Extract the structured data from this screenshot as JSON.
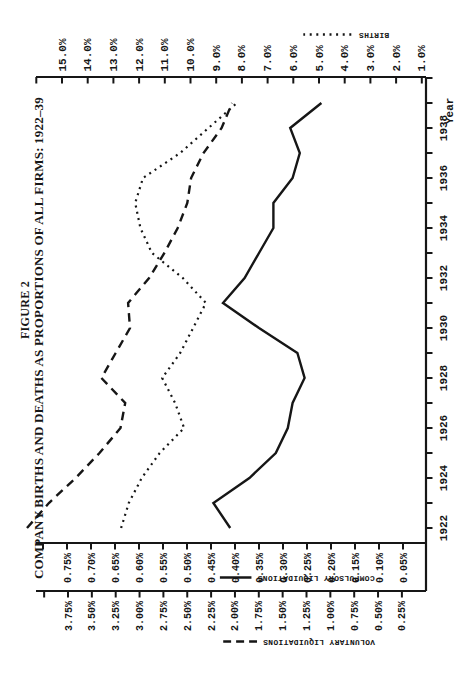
{
  "figure": {
    "title_line1": "FIGURE 2",
    "title_line2": "COMPANY BIRTHS AND DEATHS AS PROPORTIONS OF ALL FIRMS: 1922–39",
    "xaxis_title": "Year"
  },
  "legends": {
    "births": "BIRTHS",
    "compulsory": "COMPULSORY LIQUIDATIONS",
    "voluntary": "VOLUNTARY LIQUIDATIONS"
  },
  "chart_data": {
    "type": "line",
    "xlabel": "Year",
    "layout_note": "landscape chart printed rotated 90 degrees counter-clockwise on a portrait page; legend texts appear upside-down",
    "x": [
      1922,
      1923,
      1924,
      1925,
      1926,
      1927,
      1928,
      1929,
      1930,
      1931,
      1932,
      1933,
      1934,
      1935,
      1936,
      1937,
      1938,
      1939
    ],
    "x_tick_labels": [
      "1922",
      "1924",
      "1926",
      "1928",
      "1930",
      "1932",
      "1934",
      "1936",
      "1938"
    ],
    "series": [
      {
        "name": "BIRTHS",
        "style": "dotted",
        "scale": "births",
        "unit": "% of all firms",
        "values": [
          12.7,
          12.4,
          11.9,
          11.2,
          10.25,
          10.6,
          11.1,
          10.4,
          9.9,
          9.4,
          10.3,
          11.5,
          11.95,
          12.15,
          11.85,
          10.4,
          9.3,
          8.2
        ]
      },
      {
        "name": "VOLUNTARY LIQUIDATIONS",
        "style": "dashed",
        "scale": "voluntary",
        "unit": "% of all firms",
        "values": [
          4.18,
          3.95,
          3.67,
          3.42,
          3.2,
          3.15,
          3.4,
          3.25,
          3.1,
          3.12,
          2.9,
          2.74,
          2.6,
          2.5,
          2.46,
          2.33,
          2.14,
          2.03
        ]
      },
      {
        "name": "COMPULSORY LIQUIDATIONS",
        "style": "solid",
        "scale": "compulsory",
        "unit": "% of all firms",
        "values": [
          0.41,
          0.445,
          0.37,
          0.315,
          0.29,
          0.28,
          0.255,
          0.27,
          0.35,
          0.425,
          0.38,
          0.35,
          0.32,
          0.32,
          0.28,
          0.265,
          0.285,
          0.22
        ]
      }
    ],
    "axes": {
      "births": {
        "side": "right",
        "min": 1.0,
        "max": 15.0,
        "step": 1.0,
        "tick_labels": [
          "15.0%",
          "14.0%",
          "13.0%",
          "12.0%",
          "11.0%",
          "10.0%",
          "9.0%",
          "8.0%",
          "7.0%",
          "6.0%",
          "5.0%",
          "4.0%",
          "3.0%",
          "2.0%",
          "1.0%"
        ]
      },
      "compulsory": {
        "side": "left-inner",
        "min": 0.05,
        "max": 0.75,
        "step": 0.05,
        "tick_labels": [
          "0.75%",
          "0.70%",
          "0.65%",
          "0.60%",
          "0.55%",
          "0.50%",
          "0.45%",
          "0.40%",
          "0.35%",
          "0.30%",
          "0.25%",
          "0.20%",
          "0.15%",
          "0.10%",
          "0.05%"
        ]
      },
      "voluntary": {
        "side": "left-outer",
        "min": 0.25,
        "max": 3.75,
        "step": 0.25,
        "tick_labels": [
          "3.75%",
          "3.50%",
          "3.25%",
          "3.00%",
          "2.75%",
          "2.50%",
          "2.25%",
          "2.00%",
          "1.75%",
          "1.50%",
          "1.25%",
          "1.00%",
          "0.75%",
          "0.50%",
          "0.25%"
        ]
      },
      "year": {
        "side": "bottom",
        "min": 1922,
        "max": 1940,
        "tick_step": 1,
        "label_step": 2
      }
    },
    "grid": false,
    "ink_color": "#161616",
    "background_color": "#ffffff"
  }
}
